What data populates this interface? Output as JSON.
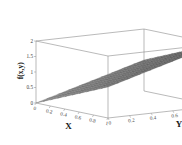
{
  "chart_data": {
    "type": "surface",
    "title": "",
    "xlabel": "X",
    "ylabel": "Y",
    "zlabel": "f(x,y)",
    "xlim": [
      0,
      1
    ],
    "ylim": [
      0,
      1
    ],
    "zlim": [
      0,
      2
    ],
    "xticks": [
      "0",
      "0.2",
      "0.4",
      "0.6",
      "0.8",
      "1"
    ],
    "yticks": [
      "0",
      "0.2",
      "0.4",
      "0.6",
      "0.8",
      "1"
    ],
    "zticks": [
      "0",
      "0.5",
      "1",
      "1.5",
      "2"
    ],
    "xtick_values": [
      0,
      0.2,
      0.4,
      0.6,
      0.8,
      1
    ],
    "ytick_values": [
      0,
      0.2,
      0.4,
      0.6,
      0.8,
      1
    ],
    "ztick_values": [
      0,
      0.5,
      1,
      1.5,
      2
    ],
    "grid": false,
    "legend": false,
    "colormap": "grayscale",
    "surface_color": "#6e6e6e",
    "mesh_color": "#4a4a4a",
    "box_color": "#8c8c8c",
    "background": "#ffffff",
    "x": [
      0,
      0.1,
      0.2,
      0.3,
      0.4,
      0.5,
      0.6,
      0.7,
      0.8,
      0.9,
      1
    ],
    "y": [
      0,
      0.1,
      0.2,
      0.3,
      0.4,
      0.5,
      0.6,
      0.7,
      0.8,
      0.9,
      1
    ],
    "z": [
      [
        0.0,
        0.1,
        0.2,
        0.3,
        0.4,
        0.5,
        0.6,
        0.7,
        0.8,
        0.9,
        1.0
      ],
      [
        0.1,
        0.2,
        0.3,
        0.4,
        0.5,
        0.6,
        0.7,
        0.8,
        0.9,
        1.0,
        1.1
      ],
      [
        0.2,
        0.3,
        0.4,
        0.5,
        0.6,
        0.7,
        0.8,
        0.9,
        1.0,
        1.1,
        1.2
      ],
      [
        0.3,
        0.4,
        0.5,
        0.6,
        0.7,
        0.8,
        0.9,
        1.0,
        1.1,
        1.2,
        1.3
      ],
      [
        0.4,
        0.5,
        0.6,
        0.7,
        0.8,
        0.9,
        1.0,
        1.1,
        1.2,
        1.3,
        1.4
      ],
      [
        0.5,
        0.6,
        0.7,
        0.8,
        0.9,
        1.0,
        1.1,
        1.2,
        1.3,
        1.4,
        1.5
      ],
      [
        0.6,
        0.7,
        0.8,
        0.9,
        1.0,
        1.1,
        1.2,
        1.3,
        1.4,
        1.5,
        1.6
      ],
      [
        0.7,
        0.8,
        0.9,
        1.0,
        1.1,
        1.2,
        1.3,
        1.4,
        1.5,
        1.6,
        1.7
      ],
      [
        0.8,
        0.9,
        1.0,
        1.1,
        1.2,
        1.3,
        1.4,
        1.5,
        1.6,
        1.7,
        1.8
      ],
      [
        0.9,
        1.0,
        1.1,
        1.2,
        1.3,
        1.4,
        1.5,
        1.6,
        1.7,
        1.8,
        1.9
      ],
      [
        1.0,
        1.1,
        1.2,
        1.3,
        1.4,
        1.5,
        1.6,
        1.7,
        1.8,
        1.9,
        2.0
      ]
    ]
  }
}
